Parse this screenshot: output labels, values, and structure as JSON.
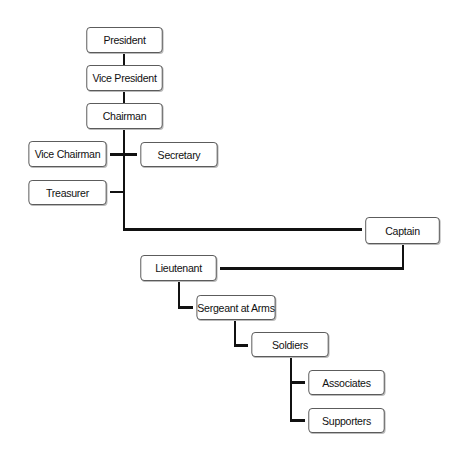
{
  "diagram": {
    "type": "org-chart",
    "line_color": "#111111",
    "box_border_color": "#555555",
    "nodes": [
      {
        "id": "president",
        "label": "President",
        "x": 83,
        "y": 27,
        "w": 83,
        "h": 26
      },
      {
        "id": "vice-president",
        "label": "Vice President",
        "x": 83,
        "y": 65,
        "w": 83,
        "h": 26
      },
      {
        "id": "chairman",
        "label": "Chairman",
        "x": 83,
        "y": 103,
        "w": 83,
        "h": 26
      },
      {
        "id": "vice-chairman",
        "label": "Vice Chairman",
        "x": 25,
        "y": 141,
        "w": 85,
        "h": 26
      },
      {
        "id": "secretary",
        "label": "Secretary",
        "x": 137,
        "y": 142,
        "w": 84,
        "h": 25
      },
      {
        "id": "treasurer",
        "label": "Treasurer",
        "x": 25,
        "y": 180,
        "w": 85,
        "h": 25
      },
      {
        "id": "captain",
        "label": "Captain",
        "x": 362,
        "y": 217,
        "w": 81,
        "h": 27
      },
      {
        "id": "lieutenant",
        "label": "Lieutenant",
        "x": 137,
        "y": 255,
        "w": 83,
        "h": 26
      },
      {
        "id": "sergeant-at-arms",
        "label": "Sergeant at Arms",
        "x": 193,
        "y": 295,
        "w": 86,
        "h": 25
      },
      {
        "id": "soldiers",
        "label": "Soldiers",
        "x": 248,
        "y": 332,
        "w": 84,
        "h": 25
      },
      {
        "id": "associates",
        "label": "Associates",
        "x": 305,
        "y": 370,
        "w": 83,
        "h": 25
      },
      {
        "id": "supporters",
        "label": "Supporters",
        "x": 305,
        "y": 408,
        "w": 83,
        "h": 25
      }
    ],
    "edges": [
      {
        "from": "president",
        "to": "vice-president"
      },
      {
        "from": "vice-president",
        "to": "chairman"
      },
      {
        "from": "chairman",
        "to": "vice-chairman"
      },
      {
        "from": "chairman",
        "to": "secretary"
      },
      {
        "from": "chairman",
        "to": "treasurer"
      },
      {
        "from": "chairman",
        "to": "captain"
      },
      {
        "from": "captain",
        "to": "lieutenant"
      },
      {
        "from": "lieutenant",
        "to": "sergeant-at-arms"
      },
      {
        "from": "sergeant-at-arms",
        "to": "soldiers"
      },
      {
        "from": "soldiers",
        "to": "associates"
      },
      {
        "from": "soldiers",
        "to": "supporters"
      }
    ]
  }
}
